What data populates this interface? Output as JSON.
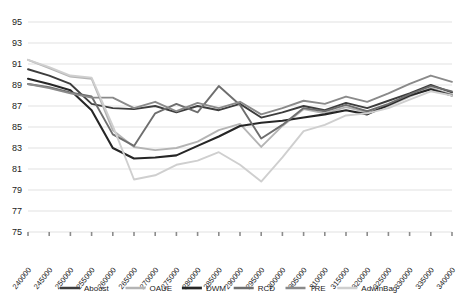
{
  "chart_data": {
    "type": "line",
    "title": "",
    "xlabel": "",
    "ylabel": "",
    "grid": true,
    "legend_position": "bottom",
    "ylim": [
      75,
      95
    ],
    "ytick_step": 2,
    "yticks": [
      75,
      77,
      79,
      81,
      83,
      85,
      87,
      89,
      91,
      93,
      95
    ],
    "categories": [
      "240000",
      "245000",
      "250000",
      "255000",
      "260000",
      "265000",
      "270000",
      "275000",
      "280000",
      "285000",
      "290000",
      "295000",
      "300000",
      "305000",
      "310000",
      "315000",
      "320000",
      "325000",
      "330000",
      "335000",
      "340000"
    ],
    "series": [
      {
        "name": "Aboost",
        "color": "#3d3d3d",
        "width": 1.9,
        "values": [
          90.5,
          89.9,
          89.1,
          87.2,
          86.8,
          86.7,
          87.0,
          86.4,
          87.0,
          86.6,
          87.2,
          85.9,
          86.4,
          87.0,
          86.6,
          87.3,
          86.8,
          87.5,
          88.2,
          89.0,
          88.3
        ]
      },
      {
        "name": "OAUE",
        "color": "#b4b4b4",
        "width": 1.9,
        "values": [
          91.4,
          90.6,
          89.8,
          89.6,
          84.7,
          83.1,
          82.8,
          83.0,
          83.6,
          84.7,
          85.3,
          83.1,
          85.1,
          86.7,
          86.3,
          86.9,
          86.4,
          87.0,
          87.9,
          88.7,
          88.1
        ]
      },
      {
        "name": "DWM",
        "color": "#262626",
        "width": 2.1,
        "values": [
          89.6,
          89.1,
          88.5,
          86.6,
          83.0,
          82.0,
          82.1,
          82.3,
          83.2,
          84.1,
          85.1,
          85.4,
          85.6,
          85.9,
          86.2,
          86.6,
          86.2,
          87.1,
          88.0,
          88.6,
          88.0
        ]
      },
      {
        "name": "RCD",
        "color": "#6e6e6e",
        "width": 1.9,
        "values": [
          89.1,
          88.8,
          88.3,
          87.9,
          84.3,
          83.2,
          86.3,
          87.2,
          86.4,
          88.9,
          87.1,
          83.9,
          85.2,
          86.8,
          86.5,
          87.1,
          86.5,
          87.2,
          88.1,
          88.9,
          88.4
        ]
      },
      {
        "name": "TRE",
        "color": "#8a8a8a",
        "width": 1.9,
        "values": [
          89.1,
          88.7,
          88.2,
          87.8,
          87.8,
          86.8,
          87.4,
          86.5,
          87.3,
          86.8,
          87.4,
          86.2,
          86.8,
          87.5,
          87.2,
          87.9,
          87.4,
          88.2,
          89.1,
          89.9,
          89.3
        ]
      },
      {
        "name": "AdwinBag",
        "color": "#cfcfcf",
        "width": 1.9,
        "values": [
          91.4,
          90.7,
          89.9,
          89.7,
          85.1,
          80.0,
          80.4,
          81.4,
          81.8,
          82.6,
          81.4,
          79.8,
          82.1,
          84.6,
          85.2,
          86.1,
          86.3,
          86.8,
          87.6,
          88.4,
          88.0
        ]
      }
    ]
  },
  "legend": {
    "items": [
      {
        "label": "Aboost"
      },
      {
        "label": "OAUE"
      },
      {
        "label": "DWM"
      },
      {
        "label": "RCD"
      },
      {
        "label": "TRE"
      },
      {
        "label": "AdwinBag"
      }
    ]
  },
  "axes": {
    "gridline_color": "#d9d9d9",
    "tick_color": "#8c8c8c"
  }
}
